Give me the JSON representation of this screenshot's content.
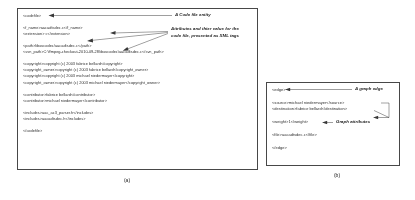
{
  "figure": {
    "panel_a": {
      "lines": [
        "<codefile>",
        "",
        "<f_name>aacadtsdec.c</f_name>",
        "<extension> c</extension>",
        "",
        "<path>libavcodec/aacadtsdec.c</path>",
        "<svn_path>C:\\ffmpeg-checkout-2010-09-28\\ibavcodec\\aacadtsdec.c</svn_path>",
        "",
        "<copyright>copyright (c) 2003 fabrice bellard</copyright>",
        "<copyright_owner>copyright (c) 2003 fabrice bellard</copyright_owner>",
        "<copyright>copyright (c) 2003 michael niedermayer</copyright>",
        "<copyright_owner>copyright (c) 2003 michael niedermayer</copyright_owner>",
        "",
        "<contributor>fabrice bellard</contributor>",
        "<contributor>michael niedermayer</contributor>",
        "",
        "<includes>aac_ac3_parser.h</includes>",
        "<includes>aacadtsdec.h</includes>",
        "",
        "</codefile>"
      ],
      "caption": "(a)"
    },
    "panel_b": {
      "lines": [
        "<edge>",
        "",
        "<source>michael niedermayer</source>",
        "<destination>fabrice bellard</destination>",
        "",
        "<weight>1</weight>",
        "",
        "<file>aacadtsdec.c</file>",
        "",
        "</edge>"
      ],
      "caption": "(b)"
    },
    "callouts": {
      "code_file_entity": "A Code file entity",
      "attributes_line1": "Attributes and thier value for the",
      "attributes_line2": "code file, presented as XML tags",
      "graph_edge": "A graph edge",
      "graph_attributes": "Graph attributes"
    },
    "colors": {
      "border": "#4a4a4a",
      "text": "#2b2b2b",
      "leader": "#3b3b3b",
      "background": "#ffffff"
    }
  }
}
